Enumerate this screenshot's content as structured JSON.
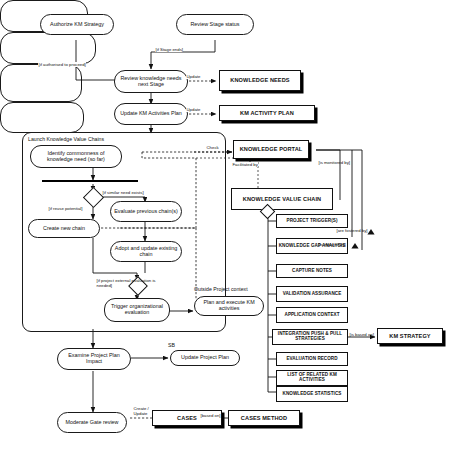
{
  "diagram": {
    "type": "uml-activity-diagram"
  },
  "frames": {
    "authorize_frame_label": "",
    "review_stage_frame_label": "",
    "launch_kvc_label": "Launch Knowledge Value Chains",
    "outside_project_label": "Outside Project context",
    "sb_label": "SB"
  },
  "activities": {
    "authorize_km_strategy": "Authorize KM Strategy",
    "review_stage_status": "Review Stage status",
    "review_knowledge_needs": "Review knowledge needs next Stage",
    "update_km_activities_plan": "Update KM Activities Plan",
    "identify_commonness": "Identify commonness of knowledge need (so far)",
    "evaluate_previous_chains": "Evaluate previous chain(s)",
    "create_new_chain": "Create new chain",
    "adopt_and_update": "Adopt and update existing chain",
    "trigger_org_evaluation": "Trigger organizational evaluation",
    "plan_and_execute": "Plan and execute KM activities",
    "examine_project_plan": "Examine Project Plan Impact",
    "update_project_plan": "Update Project Plan",
    "moderate_gate_review": "Moderate Gate review"
  },
  "artifacts": {
    "knowledge_needs": "KNOWLEDGE NEEDS",
    "km_activity_plan": "KM ACTIVITY PLAN",
    "knowledge_portal": "KNOWLEDGE PORTAL",
    "knowledge_value_chain": "KNOWLEDGE VALUE CHAIN",
    "km_strategy": "KM STRATEGY",
    "cases": "CASES",
    "cases_method": "CASES METHOD"
  },
  "kvc_components": [
    "PROJECT TRIGGER(S)",
    "KNOWLEDGE GAP ANALYSIS",
    "CAPTURE NOTES",
    "VALIDATION ASSURANCE",
    "APPLICATION CONTEXT",
    "INTEGRATION PUSH & PULL STRATEGIES",
    "EVALUATION RECORD",
    "LIST OF RELATED KM ACTIVITIES",
    "KNOWLEDGE STATISTICS"
  ],
  "edge_labels": {
    "if_stage_ends": "[if Stage ends]",
    "if_authorised": "[if authorised to proceed]",
    "update_needs": "Update",
    "update_plan": "Update",
    "check": "Check",
    "facilitated_by": "Facilitated by",
    "if_similar_need": "[if similar need exists]",
    "if_reuse_potential": "[if reuse potential]",
    "if_project_external": "[if project external evaluation is needed]",
    "is_monitored_by": "[is monitored by]",
    "are_fostered_by": "[are fostered by]",
    "is_initiated_by": "[is initiated by]",
    "is_based_on": "[is based on]",
    "create_update": "Create / Update",
    "based_on": "[based on]"
  },
  "colors": {
    "stroke": "#111111",
    "fill": "#ffffff",
    "shadow": "#000000",
    "bar": "#000000"
  }
}
